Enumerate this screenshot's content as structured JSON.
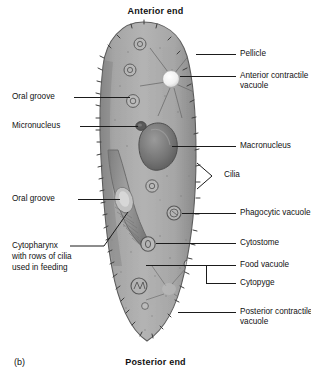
{
  "figure": {
    "panel_letter": "(b)",
    "anterior_title": "Anterior end",
    "posterior_title": "Posterior end",
    "colors": {
      "body_fill": "#a9a9a9",
      "body_edge": "#4a4a4a",
      "nucleus": "#6d6d6d",
      "vacuole_bright": "#f2f2f2",
      "leader": "#1b1b1b",
      "text": "#111111",
      "background": "#ffffff"
    }
  },
  "labels": {
    "pellicle": "Pellicle",
    "anterior_contractile_vacuole_l1": "Anterior contractile",
    "anterior_contractile_vacuole_l2": "vacuole",
    "oral_groove_upper": "Oral groove",
    "micronucleus": "Micronucleus",
    "macronucleus": "Macronucleus",
    "cilia": "Cilia",
    "oral_groove_lower": "Oral groove",
    "phagocytic_vacuole": "Phagocytic vacuole",
    "cytostome": "Cytostome",
    "cytopharynx_l1": "Cytopharynx",
    "cytopharynx_l2": "with rows of cilia",
    "cytopharynx_l3": "used in feeding",
    "food_vacuole": "Food vacuole",
    "cytopyge": "Cytopyge",
    "posterior_contractile_vacuole_l1": "Posterior contractile",
    "posterior_contractile_vacuole_l2": "vacuole"
  }
}
